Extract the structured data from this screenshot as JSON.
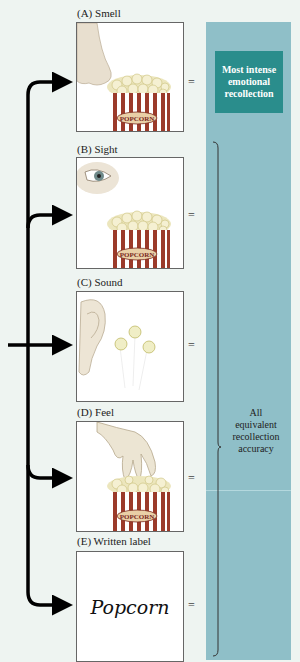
{
  "panels": [
    {
      "id": "A",
      "label": "(A)  Smell",
      "sense": "smell",
      "icon": "nose-icon",
      "stimulus": "popcorn-box"
    },
    {
      "id": "B",
      "label": "(B)  Sight",
      "sense": "sight",
      "icon": "eye-icon",
      "stimulus": "popcorn-box"
    },
    {
      "id": "C",
      "label": "(C)  Sound",
      "sense": "sound",
      "icon": "ear-icon",
      "stimulus": "popping-kernels"
    },
    {
      "id": "D",
      "label": "(D)  Feel",
      "sense": "feel",
      "icon": "hand-icon",
      "stimulus": "popcorn-box"
    },
    {
      "id": "E",
      "label": "(E)  Written label",
      "sense": "written label",
      "word": "Popcorn"
    }
  ],
  "equals_sign": "=",
  "box_text": "POPCORN",
  "result_panel": {
    "top_label": "Most intense emotional recollection",
    "bottom_label_lines": [
      "All",
      "equivalent",
      "recollection",
      "accuracy"
    ]
  },
  "colors": {
    "background": "#eef4f1",
    "result_panel": "#8fbfc8",
    "highlight_box": "#2a8d8c",
    "arrow": "#000000",
    "stripe_red": "#9b3a2a"
  }
}
